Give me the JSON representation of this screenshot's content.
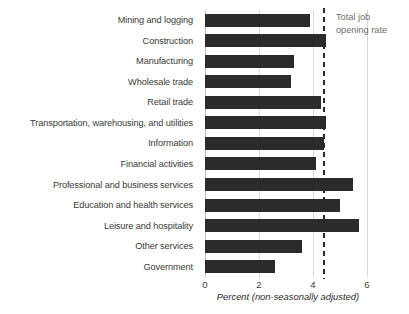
{
  "chart_data": {
    "type": "bar",
    "orientation": "horizontal",
    "title": "",
    "subtitle": "",
    "xlabel": "Percent (non-seasonally adjusted)",
    "ylabel": "",
    "xlim": [
      0,
      6.15
    ],
    "xticks": [
      0,
      2,
      4,
      6
    ],
    "xtick_labels": [
      "0",
      "2",
      "4",
      "6"
    ],
    "grid": "vertical",
    "legend": "none",
    "categories": [
      "Mining and logging",
      "Construction",
      "Manufacturing",
      "Wholesale trade",
      "Retail trade",
      "Transportation, warehousing, and utilities",
      "Information",
      "Financial activities",
      "Professional and business services",
      "Education and health services",
      "Leisure and hospitality",
      "Other services",
      "Government"
    ],
    "values": [
      3.9,
      4.5,
      3.3,
      3.2,
      4.3,
      4.5,
      4.4,
      4.1,
      5.5,
      5.0,
      5.7,
      3.6,
      2.6
    ],
    "bar_color": "#2b2b2b",
    "annotations": [
      {
        "name": "total-job-opening-rate",
        "value": 4.4,
        "line1": "Total job",
        "line2": "opening rate",
        "style": "dashed-vertical-line",
        "color": "#2b2b2b",
        "text_color": "#6e6e6e"
      }
    ]
  }
}
